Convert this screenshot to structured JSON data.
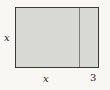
{
  "figure": {
    "type": "geometry-diagram",
    "labels": {
      "left_side": "x",
      "bottom_left_segment": "x",
      "bottom_right_segment": "3"
    },
    "colors": {
      "background": "#f8f7f4",
      "rect_fill": "#d8d8d5",
      "rect_border": "#3b3b3b",
      "divider_line": "#7d7d7d",
      "label_text": "#222222"
    }
  }
}
